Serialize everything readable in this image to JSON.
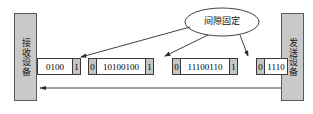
{
  "diagram": {
    "receiver": {
      "label": "接收设备"
    },
    "sender": {
      "label": "发送设备"
    },
    "callout": {
      "label": "间隙固定"
    },
    "frames": [
      {
        "id": "frame-1",
        "start_flag": "",
        "payload": "0100",
        "end_flag": "1",
        "clipped_left": true
      },
      {
        "id": "frame-2",
        "start_flag": "0",
        "payload": "10100100",
        "end_flag": "1",
        "clipped_left": false
      },
      {
        "id": "frame-3",
        "start_flag": "0",
        "payload": "11100110",
        "end_flag": "1",
        "clipped_left": false
      },
      {
        "id": "frame-4",
        "start_flag": "0",
        "payload": "1110",
        "end_flag": "",
        "clipped_left": false
      }
    ],
    "colors": {
      "device_fill": "#c9c9c9",
      "flag_fill": "#c5c5c5",
      "line": "#2b2b2b",
      "frame_border": "#3a3a3a"
    }
  }
}
